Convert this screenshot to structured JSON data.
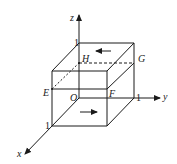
{
  "figure": {
    "type": "3d-unit-cube-coordinate-diagram",
    "axes": {
      "x": {
        "label": "x",
        "tick": "1"
      },
      "y": {
        "label": "y",
        "tick": "1"
      },
      "z": {
        "label": "z",
        "tick": "1"
      }
    },
    "points": {
      "origin": "O",
      "E": "E",
      "F": "F",
      "G": "G",
      "H": "H"
    },
    "arrows": {
      "top_face": "left",
      "bottom_face": "right"
    },
    "line_color": "#1a1a1a",
    "background": "#ffffff"
  }
}
